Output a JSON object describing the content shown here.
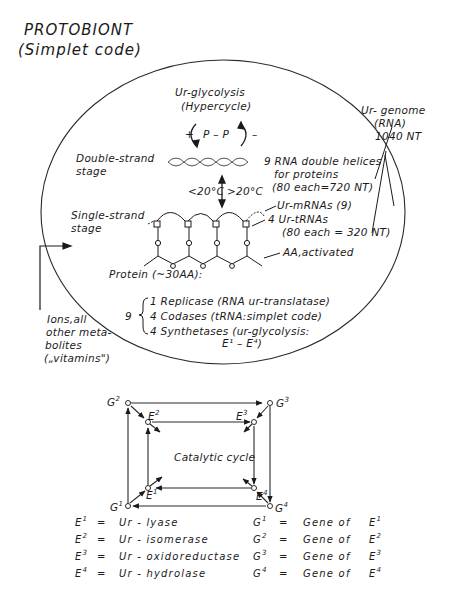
{
  "title": {
    "line1": "PROTOBIONT",
    "line2": "(Simplet code)"
  },
  "circle": {
    "hypercycle": {
      "line1": "Ur-glycolysis",
      "line2": "(Hypercycle)"
    },
    "pp_label": {
      "plus": "+",
      "pp": "P – P",
      "minus": "–"
    },
    "double_strand": {
      "line1": "Double-strand",
      "line2": "stage"
    },
    "single_strand": {
      "line1": "Single-strand",
      "line2": "stage"
    },
    "temperature": {
      "low": "<20°C",
      "high": ">20°C"
    },
    "helices": {
      "line1": "9 RNA double helices",
      "line2": "for proteins",
      "line3": "(80 each=720 NT)"
    },
    "mrnas": "Ur-mRNAs (9)",
    "trnas": {
      "line1": "4 Ur-tRNAs",
      "line2": "(80 each = 320 NT)"
    },
    "aa": "AA,activated",
    "protein": "Protein (~30AA):",
    "protein_count": "9",
    "protein_items": [
      "1 Replicase (RNA  ur-translatase)",
      "4 Codases (tRNA:simplet code)",
      "4 Synthetases (ur-glycolysis:"
    ],
    "protein_items_cont": "E¹ – E⁴)"
  },
  "genome": {
    "line1": "Ur- genome",
    "line2": "(RNA)",
    "line3": "1040 NT"
  },
  "ions": {
    "line1": "Ions,all",
    "line2": "other meta-",
    "line3": "bolites",
    "line4": "(„vitamins\")"
  },
  "cycle": {
    "label": "Catalytic cycle",
    "nodes": {
      "G1": {
        "base": "G",
        "sup": "1"
      },
      "G2": {
        "base": "G",
        "sup": "2"
      },
      "G3": {
        "base": "G",
        "sup": "3"
      },
      "G4": {
        "base": "G",
        "sup": "4"
      },
      "E1": {
        "base": "E",
        "sup": "1"
      },
      "E2": {
        "base": "E",
        "sup": "2"
      },
      "E3": {
        "base": "E",
        "sup": "3"
      },
      "E4": {
        "base": "E",
        "sup": "4"
      }
    }
  },
  "legend": {
    "enzymes": [
      {
        "sym": "E",
        "sup": "1",
        "eq": "=",
        "name": "Ur - lyase"
      },
      {
        "sym": "E",
        "sup": "2",
        "eq": "=",
        "name": "Ur - isomerase"
      },
      {
        "sym": "E",
        "sup": "3",
        "eq": "=",
        "name": "Ur - oxidoreductase"
      },
      {
        "sym": "E",
        "sup": "4",
        "eq": "=",
        "name": "Ur - hydrolase"
      }
    ],
    "genes": [
      {
        "sym": "G",
        "sup": "1",
        "eq": "=",
        "name": "Gene  of",
        "ref": "E",
        "refsup": "1"
      },
      {
        "sym": "G",
        "sup": "2",
        "eq": "=",
        "name": "Gene  of",
        "ref": "E",
        "refsup": "2"
      },
      {
        "sym": "G",
        "sup": "3",
        "eq": "=",
        "name": "Gene  of",
        "ref": "E",
        "refsup": "3"
      },
      {
        "sym": "G",
        "sup": "4",
        "eq": "=",
        "name": "Gene  of",
        "ref": "E",
        "refsup": "4"
      }
    ]
  }
}
